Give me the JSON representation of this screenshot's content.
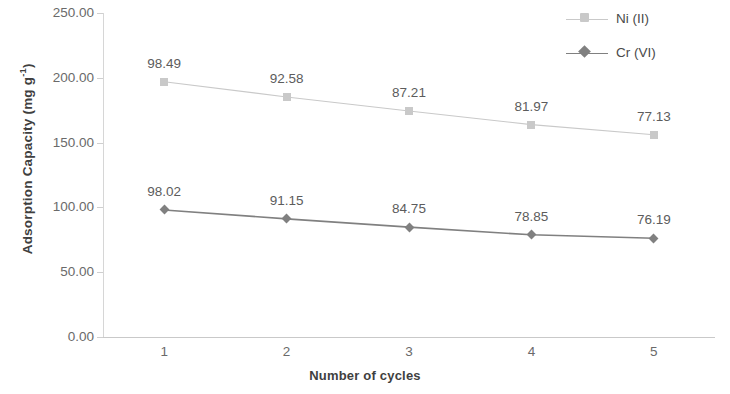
{
  "chart_data": {
    "type": "line",
    "title": "",
    "xlabel": "Number of cycles",
    "ylabel": "Adsorption Capacity (mg g-1)",
    "ylabel_base": "Adsorption Capacity (mg g",
    "ylabel_sup": "-1",
    "ylabel_tail": ")",
    "categories": [
      "1",
      "2",
      "3",
      "4",
      "5"
    ],
    "x": [
      1,
      2,
      3,
      4,
      5
    ],
    "ylim": [
      0,
      250
    ],
    "yticks": [
      "0.00",
      "50.00",
      "100.00",
      "150.00",
      "200.00",
      "250.00"
    ],
    "ytick_values": [
      0,
      50,
      100,
      150,
      200,
      250
    ],
    "grid": false,
    "legend_position": "top-right",
    "series": [
      {
        "name": "Ni (II)",
        "values": [
          98.49,
          92.58,
          87.21,
          81.97,
          77.13
        ],
        "labels": [
          "98.49",
          "92.58",
          "87.21",
          "81.97",
          "77.13"
        ],
        "plotted": [
          197.0,
          185.2,
          174.4,
          163.9,
          156.0
        ],
        "color": "#c9c9c9",
        "marker": "square"
      },
      {
        "name": "Cr (VI)",
        "values": [
          98.02,
          91.15,
          84.75,
          78.85,
          76.19
        ],
        "labels": [
          "98.02",
          "91.15",
          "84.75",
          "78.85",
          "76.19"
        ],
        "plotted": [
          98.02,
          91.15,
          84.75,
          78.85,
          76.19
        ],
        "color": "#808080",
        "marker": "diamond"
      }
    ]
  },
  "legend": {
    "items": [
      {
        "label": "Ni (II)",
        "color": "#c9c9c9",
        "marker": "square"
      },
      {
        "label": "Cr (VI)",
        "color": "#808080",
        "marker": "diamond"
      }
    ]
  },
  "colors": {
    "ni": "#c9c9c9",
    "cr": "#808080",
    "axis": "#cccccc",
    "text": "#595959"
  }
}
